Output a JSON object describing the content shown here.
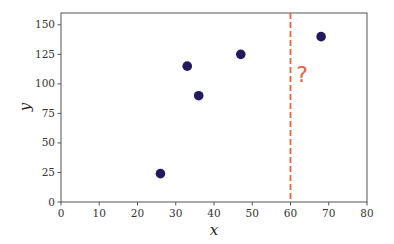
{
  "chart_data": {
    "type": "scatter",
    "title": "",
    "xlabel": "x",
    "ylabel": "y",
    "xlim": [
      0,
      80
    ],
    "ylim": [
      0,
      160
    ],
    "xticks": [
      0,
      10,
      20,
      30,
      40,
      50,
      60,
      70,
      80
    ],
    "yticks": [
      0,
      25,
      50,
      75,
      100,
      125,
      150
    ],
    "grid": false,
    "legend": null,
    "series": [
      {
        "name": "points",
        "color": "#211a5e",
        "points": [
          {
            "x": 26,
            "y": 24
          },
          {
            "x": 33,
            "y": 115
          },
          {
            "x": 36,
            "y": 90
          },
          {
            "x": 47,
            "y": 125
          },
          {
            "x": 68,
            "y": 140
          }
        ]
      }
    ],
    "annotations": [
      {
        "type": "vline",
        "x": 60,
        "style": "dashed",
        "color": "#e8623a"
      },
      {
        "type": "text",
        "text": "?",
        "x": 63,
        "y": 108,
        "color": "#e8623a"
      }
    ]
  }
}
